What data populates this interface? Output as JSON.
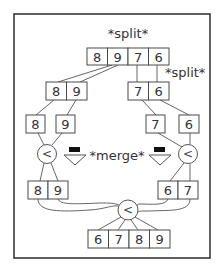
{
  "diagram": {
    "labels": {
      "split_top": "*split*",
      "split_side": "*split*",
      "merge": "*merge*"
    },
    "rows": {
      "top": [
        "8",
        "9",
        "7",
        "6"
      ],
      "level2_left": [
        "8",
        "9"
      ],
      "level2_right": [
        "7",
        "6"
      ],
      "level3": [
        "8",
        "9",
        "7",
        "6"
      ],
      "level4_left": [
        "8",
        "9"
      ],
      "level4_right": [
        "6",
        "7"
      ],
      "bottom": [
        "6",
        "7",
        "8",
        "9"
      ]
    },
    "comparators": {
      "left": "<",
      "right": "<",
      "bottom": "<"
    },
    "icons": {
      "merge_arrow_left": "down-arrow-icon",
      "merge_arrow_right": "down-arrow-icon"
    }
  }
}
